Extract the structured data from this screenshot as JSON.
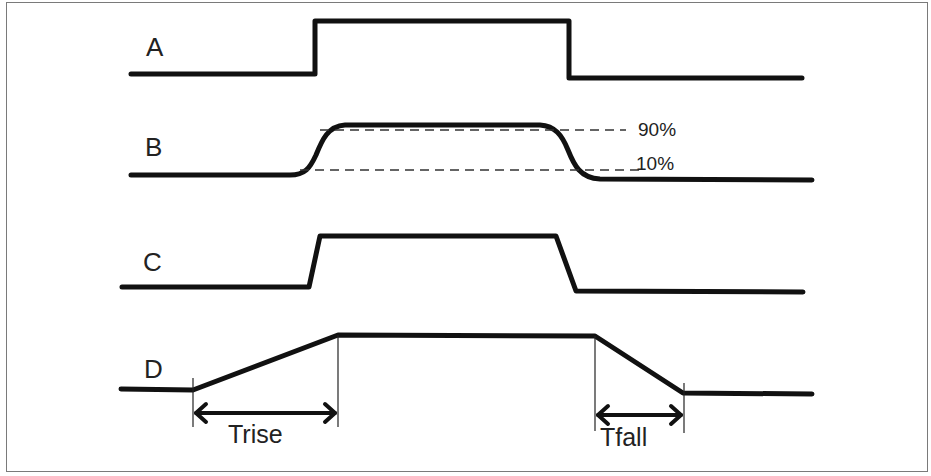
{
  "diagram": {
    "signals": [
      {
        "id": "A",
        "label": "A",
        "description": "ideal square pulse"
      },
      {
        "id": "B",
        "label": "B",
        "description": "rounded pulse with 10%/90% thresholds"
      },
      {
        "id": "C",
        "label": "C",
        "description": "trapezoidal pulse with fast edges"
      },
      {
        "id": "D",
        "label": "D",
        "description": "trapezoidal pulse with slow measured edges"
      }
    ],
    "thresholds": {
      "upper": "90%",
      "lower": "10%"
    },
    "measurements": {
      "rise": "Trise",
      "fall": "Tfall"
    },
    "colors": {
      "signal": "#111111",
      "dashes": "#333333",
      "frame": "#7a7a7a",
      "background": "#ffffff"
    }
  }
}
